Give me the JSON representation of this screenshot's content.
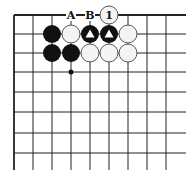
{
  "diagram": {
    "type": "go-board-fragment",
    "grid": {
      "columns_x": [
        14,
        33,
        52,
        71,
        90,
        109,
        128,
        147,
        166
      ],
      "rows_y": [
        15,
        34,
        53,
        72,
        92,
        112,
        133,
        153
      ],
      "right_extent": 186,
      "bottom_extent": 170,
      "top_edge_is_board_edge": true,
      "left_edge_is_board_edge": true
    },
    "stones": [
      {
        "col": 5,
        "row": 0,
        "color": "white",
        "label": "1"
      },
      {
        "col": 2,
        "row": 1,
        "color": "black",
        "label": ""
      },
      {
        "col": 3,
        "row": 1,
        "color": "white",
        "label": ""
      },
      {
        "col": 4,
        "row": 1,
        "color": "black",
        "label": "",
        "mark": "triangle"
      },
      {
        "col": 5,
        "row": 1,
        "color": "black",
        "label": "",
        "mark": "triangle"
      },
      {
        "col": 6,
        "row": 1,
        "color": "white",
        "label": ""
      },
      {
        "col": 2,
        "row": 2,
        "color": "black",
        "label": ""
      },
      {
        "col": 3,
        "row": 2,
        "color": "black",
        "label": ""
      },
      {
        "col": 4,
        "row": 2,
        "color": "white",
        "label": ""
      },
      {
        "col": 5,
        "row": 2,
        "color": "white",
        "label": ""
      },
      {
        "col": 6,
        "row": 2,
        "color": "white",
        "label": ""
      }
    ],
    "point_labels": [
      {
        "col": 3,
        "row": 0,
        "text": "A"
      },
      {
        "col": 4,
        "row": 0,
        "text": "B"
      }
    ],
    "markers": [
      {
        "col": 3,
        "row": 3,
        "type": "dot"
      }
    ],
    "colors": {
      "line": "#222222",
      "black_stone": "#111111",
      "white_stone_fill": "#f4f4f4",
      "white_stone_edge": "#555555",
      "background": "#ffffff"
    }
  }
}
